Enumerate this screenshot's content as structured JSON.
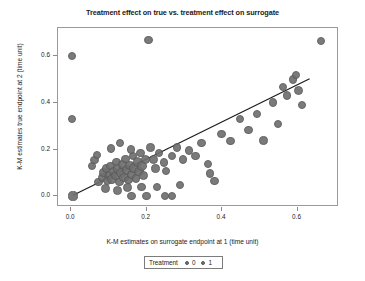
{
  "chart_data": {
    "type": "scatter",
    "title": "Treatment effect on true vs. treatment effect on surrogate",
    "xlabel": "K-M estimates on surrogate endpoint at 1 (time unit)",
    "ylabel": "K-M estimates true endpoint at 2 (time unit)",
    "xlim": [
      -0.035,
      0.71
    ],
    "ylim": [
      -0.045,
      0.72
    ],
    "xticks": [
      0.0,
      0.2,
      0.4,
      0.6
    ],
    "xtick_labels": [
      "0.0",
      "0.2",
      "0.4",
      "0.6"
    ],
    "yticks": [
      0.0,
      0.2,
      0.4,
      0.6
    ],
    "ytick_labels": [
      "0.0",
      "0.2",
      "0.4",
      "0.6"
    ],
    "grid": false,
    "legend": {
      "title": "Treatment",
      "position": "bottom",
      "entries": [
        {
          "label": "0",
          "color": "#6f6f6f"
        },
        {
          "label": "1",
          "color": "#6f6f6f"
        }
      ]
    },
    "marker_color": "#6f6f6f",
    "marker_edge_color": "#5a5a5a",
    "trend_line": {
      "color": "#1b1b1b",
      "x": [
        0.005,
        0.632
      ],
      "y": [
        0.005,
        0.503
      ]
    },
    "points": [
      {
        "x": 0.002,
        "y": 0.6,
        "r": 4.2
      },
      {
        "x": 0.002,
        "y": 0.33,
        "r": 4.2
      },
      {
        "x": 0.005,
        "y": 0.002,
        "r": 4.6
      },
      {
        "x": 0.205,
        "y": 0.668,
        "r": 4.2
      },
      {
        "x": 0.663,
        "y": 0.665,
        "r": 4.2
      },
      {
        "x": 0.072,
        "y": 0.062,
        "r": 4.4
      },
      {
        "x": 0.082,
        "y": 0.08,
        "r": 4.6
      },
      {
        "x": 0.086,
        "y": 0.103,
        "r": 4.2
      },
      {
        "x": 0.092,
        "y": 0.118,
        "r": 4.4
      },
      {
        "x": 0.096,
        "y": 0.068,
        "r": 4.8
      },
      {
        "x": 0.1,
        "y": 0.092,
        "r": 4.4
      },
      {
        "x": 0.104,
        "y": 0.13,
        "r": 4.2
      },
      {
        "x": 0.108,
        "y": 0.075,
        "r": 5.0
      },
      {
        "x": 0.112,
        "y": 0.108,
        "r": 4.4
      },
      {
        "x": 0.118,
        "y": 0.088,
        "r": 4.6
      },
      {
        "x": 0.12,
        "y": 0.148,
        "r": 4.2
      },
      {
        "x": 0.124,
        "y": 0.118,
        "r": 4.8
      },
      {
        "x": 0.128,
        "y": 0.062,
        "r": 4.4
      },
      {
        "x": 0.132,
        "y": 0.1,
        "r": 5.2
      },
      {
        "x": 0.136,
        "y": 0.138,
        "r": 4.4
      },
      {
        "x": 0.14,
        "y": 0.082,
        "r": 4.6
      },
      {
        "x": 0.144,
        "y": 0.16,
        "r": 4.2
      },
      {
        "x": 0.148,
        "y": 0.112,
        "r": 5.0
      },
      {
        "x": 0.152,
        "y": 0.07,
        "r": 4.4
      },
      {
        "x": 0.156,
        "y": 0.132,
        "r": 4.8
      },
      {
        "x": 0.16,
        "y": 0.095,
        "r": 4.6
      },
      {
        "x": 0.164,
        "y": 0.172,
        "r": 4.2
      },
      {
        "x": 0.168,
        "y": 0.122,
        "r": 5.4
      },
      {
        "x": 0.172,
        "y": 0.078,
        "r": 4.4
      },
      {
        "x": 0.176,
        "y": 0.148,
        "r": 4.8
      },
      {
        "x": 0.18,
        "y": 0.105,
        "r": 4.6
      },
      {
        "x": 0.184,
        "y": 0.186,
        "r": 4.2
      },
      {
        "x": 0.188,
        "y": 0.13,
        "r": 5.0
      },
      {
        "x": 0.192,
        "y": 0.088,
        "r": 4.4
      },
      {
        "x": 0.196,
        "y": 0.158,
        "r": 4.6
      },
      {
        "x": 0.055,
        "y": 0.13,
        "r": 4.2
      },
      {
        "x": 0.062,
        "y": 0.155,
        "r": 4.2
      },
      {
        "x": 0.068,
        "y": 0.178,
        "r": 4.2
      },
      {
        "x": 0.105,
        "y": 0.205,
        "r": 4.2
      },
      {
        "x": 0.13,
        "y": 0.228,
        "r": 4.2
      },
      {
        "x": 0.158,
        "y": 0.2,
        "r": 4.2
      },
      {
        "x": 0.21,
        "y": 0.21,
        "r": 4.2
      },
      {
        "x": 0.218,
        "y": 0.158,
        "r": 4.4
      },
      {
        "x": 0.224,
        "y": 0.12,
        "r": 4.2
      },
      {
        "x": 0.232,
        "y": 0.185,
        "r": 4.2
      },
      {
        "x": 0.246,
        "y": 0.145,
        "r": 4.2
      },
      {
        "x": 0.252,
        "y": 0.108,
        "r": 4.2
      },
      {
        "x": 0.268,
        "y": 0.172,
        "r": 4.2
      },
      {
        "x": 0.28,
        "y": 0.21,
        "r": 4.2
      },
      {
        "x": 0.296,
        "y": 0.158,
        "r": 4.2
      },
      {
        "x": 0.312,
        "y": 0.196,
        "r": 4.2
      },
      {
        "x": 0.33,
        "y": 0.172,
        "r": 4.2
      },
      {
        "x": 0.345,
        "y": 0.228,
        "r": 4.2
      },
      {
        "x": 0.362,
        "y": 0.14,
        "r": 4.2
      },
      {
        "x": 0.398,
        "y": 0.268,
        "r": 4.2
      },
      {
        "x": 0.422,
        "y": 0.238,
        "r": 4.2
      },
      {
        "x": 0.448,
        "y": 0.33,
        "r": 4.2
      },
      {
        "x": 0.47,
        "y": 0.285,
        "r": 4.2
      },
      {
        "x": 0.492,
        "y": 0.352,
        "r": 4.2
      },
      {
        "x": 0.51,
        "y": 0.24,
        "r": 4.2
      },
      {
        "x": 0.535,
        "y": 0.402,
        "r": 4.2
      },
      {
        "x": 0.548,
        "y": 0.31,
        "r": 4.2
      },
      {
        "x": 0.562,
        "y": 0.468,
        "r": 4.2
      },
      {
        "x": 0.572,
        "y": 0.432,
        "r": 4.2
      },
      {
        "x": 0.588,
        "y": 0.5,
        "r": 4.2
      },
      {
        "x": 0.596,
        "y": 0.52,
        "r": 4.2
      },
      {
        "x": 0.602,
        "y": 0.452,
        "r": 4.6
      },
      {
        "x": 0.612,
        "y": 0.392,
        "r": 4.2
      },
      {
        "x": 0.368,
        "y": 0.098,
        "r": 4.2
      },
      {
        "x": 0.38,
        "y": 0.065,
        "r": 4.2
      },
      {
        "x": 0.16,
        "y": 0.002,
        "r": 4.2
      },
      {
        "x": 0.2,
        "y": 0.002,
        "r": 4.2
      },
      {
        "x": 0.248,
        "y": 0.002,
        "r": 4.2
      },
      {
        "x": 0.268,
        "y": 0.002,
        "r": 4.2
      },
      {
        "x": 0.228,
        "y": 0.04,
        "r": 4.2
      },
      {
        "x": 0.288,
        "y": 0.048,
        "r": 4.2
      },
      {
        "x": 0.186,
        "y": 0.04,
        "r": 4.2
      },
      {
        "x": 0.122,
        "y": 0.025,
        "r": 4.4
      },
      {
        "x": 0.15,
        "y": 0.038,
        "r": 4.4
      },
      {
        "x": 0.09,
        "y": 0.035,
        "r": 4.4
      }
    ]
  }
}
